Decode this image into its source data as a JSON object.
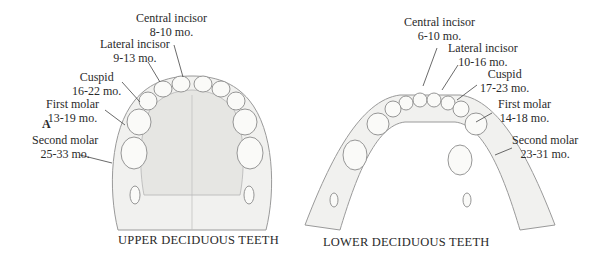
{
  "figure_letter": "A",
  "upper": {
    "caption": "UPPER DECIDUOUS TEETH",
    "teeth": [
      {
        "name": "Central incisor",
        "age": "8-10 mo."
      },
      {
        "name": "Lateral incisor",
        "age": "9-13 mo."
      },
      {
        "name": "Cuspid",
        "age": "16-22 mo."
      },
      {
        "name": "First molar",
        "age": "13-19 mo."
      },
      {
        "name": "Second molar",
        "age": "25-33 mo."
      }
    ]
  },
  "lower": {
    "caption": "LOWER DECIDUOUS TEETH",
    "teeth": [
      {
        "name": "Central incisor",
        "age": "6-10 mo."
      },
      {
        "name": "Lateral incisor",
        "age": "10-16 mo."
      },
      {
        "name": "Cuspid",
        "age": "17-23 mo."
      },
      {
        "name": "First molar",
        "age": "14-18 mo."
      },
      {
        "name": "Second molar",
        "age": "23-31 mo."
      }
    ]
  }
}
